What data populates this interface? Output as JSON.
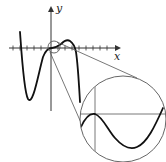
{
  "figure": {
    "axes": {
      "x_label": "x",
      "y_label": "y"
    },
    "colors": {
      "curve": "#111111",
      "axes": "#333333",
      "circle": "#555555",
      "background": "#ffffff"
    },
    "main_plot": {
      "x_ticks_count": 13,
      "small_circle": {
        "cx": 54,
        "cy": 47,
        "r": 6
      }
    },
    "inset": {
      "type": "magnifying-circle",
      "circle": {
        "cx": 123,
        "cy": 119,
        "r": 43
      }
    }
  }
}
